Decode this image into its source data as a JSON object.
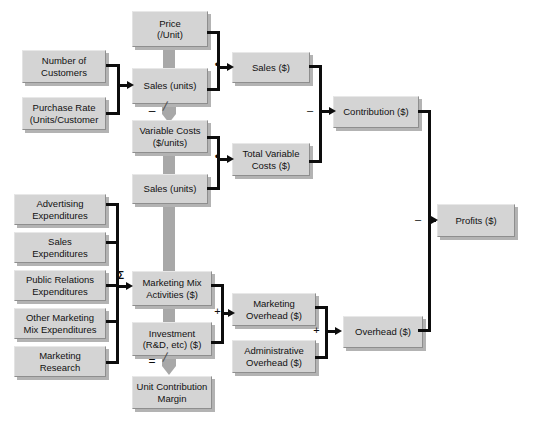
{
  "diagram": {
    "colors": {
      "box_fill": "#d4d4d4",
      "box_border": "#8e8e8e",
      "box_shadow": "#b3b3b3",
      "connector": "#0d0d0d",
      "thick_link": "#a8a8a8",
      "background": "#ffffff"
    },
    "nodes": [
      {
        "id": "price",
        "label": "Price\n(/Unit)"
      },
      {
        "id": "customers",
        "label": "Number of\nCustomers"
      },
      {
        "id": "sales_units_1",
        "label": "Sales (units)"
      },
      {
        "id": "purchase_rate",
        "label": "Purchase Rate\n(Units/Customer"
      },
      {
        "id": "sales_dollars",
        "label": "Sales ($)"
      },
      {
        "id": "variable_costs",
        "label": "Variable Costs\n($/units)"
      },
      {
        "id": "sales_units_2",
        "label": "Sales (units)"
      },
      {
        "id": "total_var_costs",
        "label": "Total Variable\nCosts ($)"
      },
      {
        "id": "contribution",
        "label": "Contribution ($)"
      },
      {
        "id": "advertising",
        "label": "Advertising\nExpenditures"
      },
      {
        "id": "sales_exp",
        "label": "Sales\nExpenditures"
      },
      {
        "id": "public_rel",
        "label": "Public Relations\nExpenditures"
      },
      {
        "id": "other_mix",
        "label": "Other Marketing\nMix Expenditures"
      },
      {
        "id": "mkt_research",
        "label": "Marketing\nResearch"
      },
      {
        "id": "mkt_mix",
        "label": "Marketing Mix\nActivities ($)"
      },
      {
        "id": "investment",
        "label": "Investment\n(R&D, etc) ($)"
      },
      {
        "id": "unit_contrib",
        "label": "Unit Contribution\nMargin"
      },
      {
        "id": "mkt_overhead",
        "label": "Marketing\nOverhead ($)"
      },
      {
        "id": "admin_overhead",
        "label": "Administrative\nOverhead ($)"
      },
      {
        "id": "overhead",
        "label": "Overhead ($)"
      },
      {
        "id": "profits",
        "label": "Profits ($)"
      }
    ],
    "operators": [
      {
        "id": "mult_sales",
        "symbol": "•",
        "meaning": "multiply"
      },
      {
        "id": "minus_vc",
        "symbol": "–",
        "meaning": "minus"
      },
      {
        "id": "mult_varcost",
        "symbol": "•",
        "meaning": "multiply"
      },
      {
        "id": "minus_contrib",
        "symbol": "–",
        "meaning": "minus"
      },
      {
        "id": "sigma_mix",
        "symbol": "Σ",
        "meaning": "summation"
      },
      {
        "id": "plus_overhead",
        "symbol": "+",
        "meaning": "plus"
      },
      {
        "id": "plus_oh_total",
        "symbol": "+",
        "meaning": "plus"
      },
      {
        "id": "equals_ucm",
        "symbol": "=",
        "meaning": "equals"
      },
      {
        "id": "minus_profits",
        "symbol": "–",
        "meaning": "minus"
      }
    ]
  }
}
